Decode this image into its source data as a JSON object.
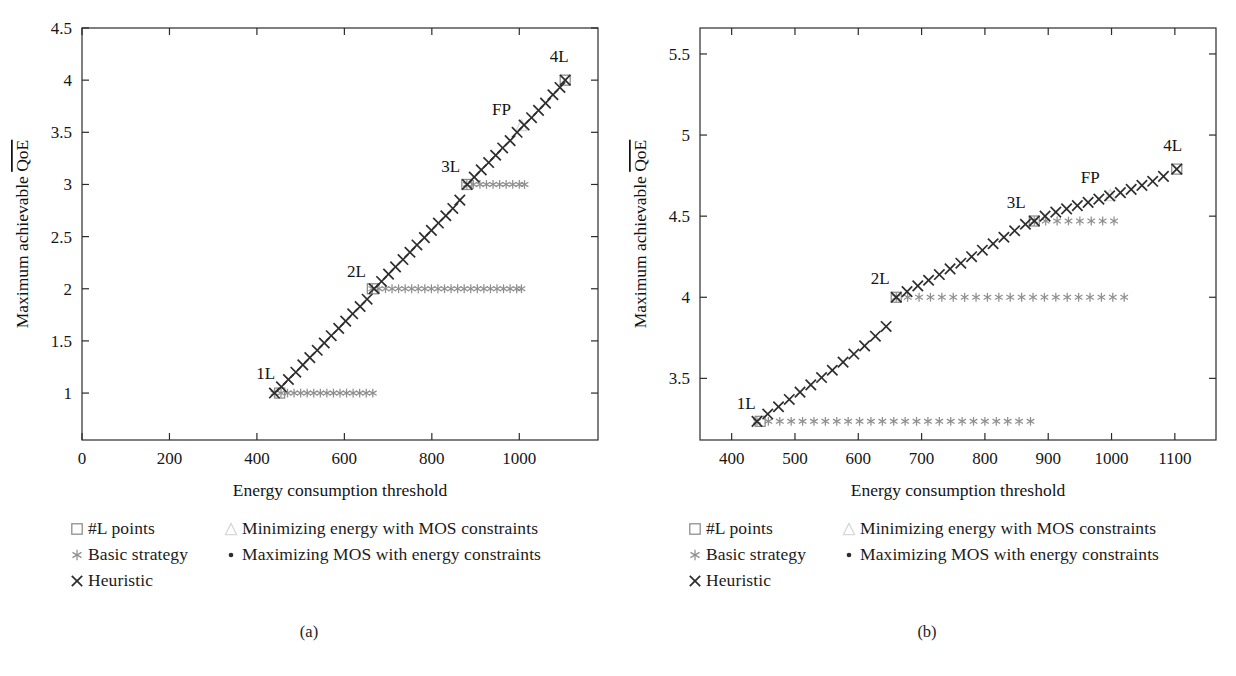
{
  "figure": {
    "panels": [
      {
        "id": "a",
        "caption": "(a)",
        "xlabel": "Energy consumption threshold",
        "ylabel": "Maximum achievable QoE",
        "ylabel_overline_part": "QoE",
        "ylabel_prefix": "Maximum achievable "
      },
      {
        "id": "b",
        "caption": "(b)",
        "xlabel": "Energy consumption threshold",
        "ylabel": "Maximum achievable QoE",
        "ylabel_overline_part": "QoE",
        "ylabel_prefix": "Maximum achievable "
      }
    ]
  },
  "legend": {
    "entries": [
      {
        "marker": "square-marker",
        "label": "#L points",
        "color": "#8f8f8f",
        "column": 0,
        "row": 0
      },
      {
        "marker": "asterisk-marker",
        "label": "Basic strategy",
        "color": "#8f8f8f",
        "column": 0,
        "row": 1
      },
      {
        "marker": "cross-marker",
        "label": "Heuristic",
        "color": "#2d2d2d",
        "column": 0,
        "row": 2
      },
      {
        "marker": "triangle-marker",
        "label": "Minimizing energy with MOS constraints",
        "color": "#d8d8d8",
        "column": 1,
        "row": 0
      },
      {
        "marker": "dot-marker",
        "label": "Maximizing MOS with energy constraints",
        "color": "#2d2d2d",
        "column": 1,
        "row": 1
      }
    ]
  },
  "chart_data": [
    {
      "type": "scatter",
      "panel": "a",
      "title": "",
      "xlabel": "Energy consumption threshold",
      "ylabel": "Maximum achievable QoE",
      "xlim": [
        0,
        1180
      ],
      "ylim": [
        0.55,
        4.5
      ],
      "xticks": [
        0,
        200,
        400,
        600,
        800,
        1000
      ],
      "yticks": [
        1,
        1.5,
        2,
        2.5,
        3,
        3.5,
        4,
        4.5
      ],
      "xtick_labels": [
        "0",
        "200",
        "400",
        "600",
        "800",
        "1000"
      ],
      "ytick_labels": [
        "1",
        "1.5",
        "2",
        "2.5",
        "3",
        "3.5",
        "4",
        "4.5"
      ],
      "grid": false,
      "legend_position": "below-figure",
      "annotations": [
        {
          "text": "1L",
          "x": 452,
          "y": 1.0,
          "dx": -14,
          "dy": -14
        },
        {
          "text": "2L",
          "x": 664,
          "y": 2.0,
          "dx": -16,
          "dy": -12
        },
        {
          "text": "3L",
          "x": 880,
          "y": 3.0,
          "dx": -16,
          "dy": -12
        },
        {
          "text": "FP",
          "x": 1005,
          "y": 3.57,
          "dx": -20,
          "dy": -10
        },
        {
          "text": "4L",
          "x": 1105,
          "y": 4.0,
          "dx": -6,
          "dy": -18
        }
      ],
      "series": [
        {
          "name": "Heuristic",
          "marker": "cross-marker",
          "color": "#2d2d2d",
          "x": [
            440,
            456,
            472,
            489,
            505,
            521,
            538,
            554,
            570,
            587,
            603,
            619,
            636,
            652,
            668,
            685,
            701,
            717,
            734,
            750,
            766,
            783,
            799,
            815,
            832,
            848,
            864,
            881,
            897,
            913,
            930,
            946,
            962,
            979,
            995,
            1011,
            1028,
            1044,
            1060,
            1077,
            1093,
            1105
          ],
          "y": [
            1.0,
            1.06,
            1.13,
            1.2,
            1.27,
            1.34,
            1.41,
            1.48,
            1.55,
            1.62,
            1.69,
            1.76,
            1.83,
            1.9,
            2.0,
            2.07,
            2.14,
            2.21,
            2.28,
            2.35,
            2.42,
            2.49,
            2.56,
            2.63,
            2.7,
            2.77,
            2.85,
            3.0,
            3.07,
            3.14,
            3.21,
            3.28,
            3.35,
            3.42,
            3.5,
            3.57,
            3.64,
            3.71,
            3.78,
            3.86,
            3.93,
            4.0
          ]
        },
        {
          "name": "Basic strategy (step 1)",
          "marker": "asterisk-marker",
          "color": "#8f8f8f",
          "x": [
            440,
            455,
            470,
            485,
            500,
            515,
            530,
            545,
            560,
            575,
            590,
            605,
            620,
            635,
            650,
            665
          ],
          "y": [
            1.0,
            1.0,
            1.0,
            1.0,
            1.0,
            1.0,
            1.0,
            1.0,
            1.0,
            1.0,
            1.0,
            1.0,
            1.0,
            1.0,
            1.0,
            1.0
          ]
        },
        {
          "name": "Basic strategy (step 2)",
          "marker": "asterisk-marker",
          "color": "#8f8f8f",
          "x": [
            664,
            679,
            694,
            709,
            724,
            739,
            754,
            769,
            784,
            799,
            814,
            829,
            844,
            859,
            874,
            889,
            904,
            919,
            934,
            949,
            964,
            979,
            994,
            1005
          ],
          "y": [
            2.0,
            2.0,
            2.0,
            2.0,
            2.0,
            2.0,
            2.0,
            2.0,
            2.0,
            2.0,
            2.0,
            2.0,
            2.0,
            2.0,
            2.0,
            2.0,
            2.0,
            2.0,
            2.0,
            2.0,
            2.0,
            2.0,
            2.0,
            2.0
          ]
        },
        {
          "name": "Basic strategy (step 3)",
          "marker": "asterisk-marker",
          "color": "#8f8f8f",
          "x": [
            880,
            895,
            910,
            925,
            940,
            955,
            970,
            985,
            1000,
            1012
          ],
          "y": [
            3.0,
            3.0,
            3.0,
            3.0,
            3.0,
            3.0,
            3.0,
            3.0,
            3.0,
            3.0
          ]
        },
        {
          "name": "#L points",
          "marker": "square-marker",
          "color": "#8f8f8f",
          "x": [
            452,
            664,
            880,
            1105
          ],
          "y": [
            1.0,
            2.0,
            3.0,
            4.0
          ]
        },
        {
          "name": "Minimizing energy with MOS constraints",
          "marker": "triangle-marker",
          "color": "#d8d8d8",
          "x": [
            1005
          ],
          "y": [
            3.57
          ]
        }
      ]
    },
    {
      "type": "scatter",
      "panel": "b",
      "title": "",
      "xlabel": "Energy consumption threshold",
      "ylabel": "Maximum achievable QoE",
      "xlim": [
        350,
        1165
      ],
      "ylim": [
        3.12,
        5.66
      ],
      "xticks": [
        400,
        500,
        600,
        700,
        800,
        900,
        1000,
        1100
      ],
      "yticks": [
        3.5,
        4,
        4.5,
        5,
        5.5
      ],
      "xtick_labels": [
        "400",
        "500",
        "600",
        "700",
        "800",
        "900",
        "1000",
        "1100"
      ],
      "ytick_labels": [
        "3.5",
        "4",
        "4.5",
        "5",
        "5.5"
      ],
      "grid": false,
      "legend_position": "below-figure",
      "annotations": [
        {
          "text": "1L",
          "x": 445,
          "y": 3.24,
          "dx": -14,
          "dy": -12
        },
        {
          "text": "2L",
          "x": 660,
          "y": 4.0,
          "dx": -16,
          "dy": -13
        },
        {
          "text": "3L",
          "x": 878,
          "y": 4.47,
          "dx": -18,
          "dy": -13
        },
        {
          "text": "FP",
          "x": 998,
          "y": 4.63,
          "dx": -20,
          "dy": -12
        },
        {
          "text": "4L",
          "x": 1103,
          "y": 4.79,
          "dx": -4,
          "dy": -18
        }
      ],
      "series": [
        {
          "name": "Heuristic",
          "marker": "cross-marker",
          "color": "#2d2d2d",
          "x": [
            440,
            457,
            474,
            491,
            508,
            525,
            542,
            559,
            576,
            593,
            610,
            627,
            644,
            660,
            677,
            694,
            711,
            728,
            745,
            762,
            779,
            796,
            813,
            830,
            847,
            864,
            878,
            895,
            912,
            929,
            946,
            963,
            980,
            997,
            1014,
            1031,
            1048,
            1065,
            1082,
            1103
          ],
          "y": [
            3.235,
            3.28,
            3.325,
            3.37,
            3.415,
            3.46,
            3.505,
            3.55,
            3.6,
            3.65,
            3.7,
            3.76,
            3.82,
            4.0,
            4.035,
            4.07,
            4.105,
            4.14,
            4.175,
            4.21,
            4.25,
            4.29,
            4.33,
            4.37,
            4.41,
            4.45,
            4.47,
            4.5,
            4.525,
            4.545,
            4.565,
            4.585,
            4.605,
            4.625,
            4.645,
            4.665,
            4.69,
            4.715,
            4.745,
            4.79
          ]
        },
        {
          "name": "Basic strategy (step 1)",
          "marker": "asterisk-marker",
          "color": "#8f8f8f",
          "x": [
            440,
            458,
            476,
            494,
            512,
            530,
            548,
            566,
            584,
            602,
            620,
            638,
            656,
            674,
            692,
            710,
            728,
            746,
            764,
            782,
            800,
            818,
            836,
            854,
            872
          ],
          "y": [
            3.235,
            3.235,
            3.235,
            3.235,
            3.235,
            3.235,
            3.235,
            3.235,
            3.235,
            3.235,
            3.235,
            3.235,
            3.235,
            3.235,
            3.235,
            3.235,
            3.235,
            3.235,
            3.235,
            3.235,
            3.235,
            3.235,
            3.235,
            3.235,
            3.235
          ]
        },
        {
          "name": "Basic strategy (step 2)",
          "marker": "asterisk-marker",
          "color": "#8f8f8f",
          "x": [
            660,
            678,
            696,
            714,
            732,
            750,
            768,
            786,
            804,
            822,
            840,
            858,
            876,
            894,
            912,
            930,
            948,
            966,
            984,
            1002,
            1020
          ],
          "y": [
            4.0,
            4.0,
            4.0,
            4.0,
            4.0,
            4.0,
            4.0,
            4.0,
            4.0,
            4.0,
            4.0,
            4.0,
            4.0,
            4.0,
            4.0,
            4.0,
            4.0,
            4.0,
            4.0,
            4.0,
            4.0
          ]
        },
        {
          "name": "Basic strategy (step 3)",
          "marker": "asterisk-marker",
          "color": "#8f8f8f",
          "x": [
            878,
            896,
            914,
            932,
            950,
            968,
            986,
            1004
          ],
          "y": [
            4.47,
            4.47,
            4.47,
            4.47,
            4.47,
            4.47,
            4.47,
            4.47
          ]
        },
        {
          "name": "#L points",
          "marker": "square-marker",
          "color": "#8f8f8f",
          "x": [
            445,
            660,
            878,
            1103
          ],
          "y": [
            3.235,
            4.0,
            4.47,
            4.79
          ]
        },
        {
          "name": "Minimizing energy with MOS constraints",
          "marker": "triangle-marker",
          "color": "#d8d8d8",
          "x": [
            998
          ],
          "y": [
            4.63
          ]
        }
      ]
    }
  ]
}
